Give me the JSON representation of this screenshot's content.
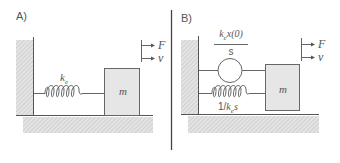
{
  "panels": [
    {
      "id": "A",
      "label": "A)",
      "spring": {
        "symbol": "k",
        "subscript": "e"
      },
      "mass": {
        "label": "m"
      },
      "force": {
        "label": "F"
      },
      "velocity": {
        "label": "v"
      }
    },
    {
      "id": "B",
      "label": "B)",
      "source": {
        "numerator_symbol": "k",
        "numerator_subscript": "e",
        "numerator_rest": "x(0)",
        "denominator": "s"
      },
      "spring": {
        "prefix": "1/",
        "symbol": "k",
        "subscript": "e",
        "suffix": "s"
      },
      "mass": {
        "label": "m"
      },
      "force": {
        "label": "F"
      },
      "velocity": {
        "label": "v"
      }
    }
  ],
  "colors": {
    "line": "#555555",
    "hatch": "#cfcfcf",
    "mass_fill": "#e6e6e6",
    "divider": "#444444"
  }
}
